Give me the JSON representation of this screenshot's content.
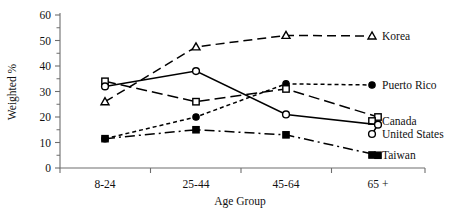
{
  "chart_data": {
    "type": "line",
    "title": "",
    "subtitle": "",
    "xlabel": "Age Group",
    "ylabel": "Weighted %",
    "categories": [
      "8-24",
      "25-44",
      "45-64",
      "65 +"
    ],
    "ylim": [
      0,
      60
    ],
    "ytick_labels": [
      "0",
      "10",
      "20",
      "30",
      "40",
      "50",
      "60"
    ],
    "ytick_values": [
      0,
      10,
      20,
      30,
      40,
      50,
      60
    ],
    "yminor_step": 5,
    "grid": false,
    "legend_position": "right-inline-labels",
    "series": [
      {
        "name": "Korea",
        "marker": "open-triangle",
        "line_style": "dashed",
        "values": [
          26,
          47.5,
          52,
          null
        ],
        "label_x": 382,
        "label_y": 40
      },
      {
        "name": "Puerto Rico",
        "marker": "filled-circle",
        "line_style": "dotted",
        "values": [
          11.5,
          20,
          33,
          null
        ],
        "label_x": 382,
        "label_y": 89
      },
      {
        "name": "Canada",
        "marker": "open-square",
        "line_style": "long-dashed",
        "values": [
          34,
          26,
          31,
          20
        ],
        "label_x": 382,
        "label_y": 125
      },
      {
        "name": "United States",
        "marker": "open-circle",
        "line_style": "solid",
        "values": [
          32,
          38,
          21,
          17
        ],
        "label_x": 382,
        "label_y": 138
      },
      {
        "name": "Taiwan",
        "marker": "filled-square",
        "line_style": "dash-dot",
        "values": [
          11.5,
          15,
          13,
          5
        ],
        "label_x": 382,
        "label_y": 159
      }
    ]
  },
  "axis": {
    "y_label": "Weighted %",
    "x_label": "Age Group",
    "y_ticks": [
      "60",
      "50",
      "40",
      "30",
      "20",
      "10",
      "0"
    ],
    "x_ticks": [
      "8-24",
      "25-44",
      "45-64",
      "65 +"
    ]
  },
  "legend": {
    "items": [
      {
        "label": "Korea"
      },
      {
        "label": "Puerto Rico"
      },
      {
        "label": "Canada"
      },
      {
        "label": "United States"
      },
      {
        "label": "Taiwan"
      }
    ]
  }
}
